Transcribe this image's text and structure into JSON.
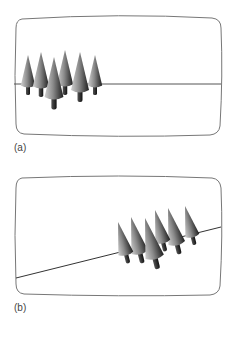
{
  "figure": {
    "panels": [
      {
        "id": "a",
        "label": "(a)",
        "horizon": "level",
        "trees": 7
      },
      {
        "id": "b",
        "label": "(b)",
        "horizon": "tilted",
        "trees": 7
      }
    ],
    "colors": {
      "frame": "#777777",
      "horizon": "#555555",
      "tree_dark": "#222222",
      "tree_light": "#dddddd"
    }
  }
}
